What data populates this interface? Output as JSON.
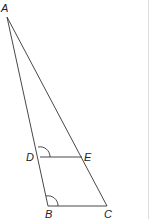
{
  "diagram": {
    "type": "geometry-triangle",
    "points": {
      "A": {
        "label": "A",
        "x": 7,
        "y": 17
      },
      "B": {
        "label": "B",
        "x": 48,
        "y": 206
      },
      "C": {
        "label": "C",
        "x": 107,
        "y": 206
      },
      "D": {
        "label": "D",
        "x": 40,
        "y": 157
      },
      "E": {
        "label": "E",
        "x": 82,
        "y": 157
      }
    },
    "segments": [
      "AB",
      "AC",
      "BC",
      "DE"
    ],
    "angle_marks": [
      "ADE",
      "ABC"
    ],
    "colors": {
      "line": "#333333",
      "border": "#dddddd"
    }
  }
}
